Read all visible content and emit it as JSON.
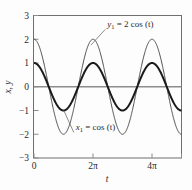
{
  "chart_data": {
    "type": "line",
    "title": "",
    "xlabel": "t",
    "ylabel": "x, y",
    "xlim": [
      0,
      15.708
    ],
    "ylim": [
      -3,
      3
    ],
    "grid": false,
    "legend_position": "inline-annotations",
    "x_ticks": [
      {
        "value": 0,
        "label": "0"
      },
      {
        "value": 6.2832,
        "label": "2π"
      },
      {
        "value": 12.5664,
        "label": "4π"
      },
      {
        "value": 15.708,
        "label": ""
      }
    ],
    "y_ticks": [
      {
        "value": 3,
        "label": "3"
      },
      {
        "value": 2,
        "label": "2"
      },
      {
        "value": 1,
        "label": "1"
      },
      {
        "value": 0,
        "label": "0"
      },
      {
        "value": -1,
        "label": "-1"
      },
      {
        "value": -2,
        "label": "-2"
      },
      {
        "value": -3,
        "label": "-3"
      }
    ],
    "zero_line": {
      "value": 0,
      "color": "#8c8c8c"
    },
    "series": [
      {
        "name": "y1",
        "expression": "y₁ = 2 cos (t)",
        "amplitude": 2,
        "phase": 0,
        "period": 6.2832,
        "linewidth": 0.9,
        "color": "#3a3a3a",
        "annotation": {
          "text": "y₁ = 2 cos (t)",
          "text_x": 7.8,
          "text_y": 2.52,
          "leader_to_x": 6.05,
          "leader_to_y": 1.75
        }
      },
      {
        "name": "x1",
        "expression": "x₁ = cos (t)",
        "amplitude": 1,
        "phase": 0,
        "period": 6.2832,
        "linewidth": 2.0,
        "color": "#1a1a1a",
        "annotation": {
          "text": "x₁ = cos (t)",
          "text_x": 4.45,
          "text_y": -1.82,
          "leader_to_x": 3.15,
          "leader_to_y": -0.98
        }
      }
    ]
  },
  "axis": {
    "y_label_text": "x, y",
    "x_label_text": "t"
  },
  "labels": {
    "y1_prefix": "y",
    "y1_sub": "1",
    "y1_rest": " = 2 cos (t)",
    "x1_prefix": "x",
    "x1_sub": "1",
    "x1_rest": " = cos (t)"
  },
  "colors": {
    "frame": "#6f6f6f",
    "zero_line": "#8c8c8c",
    "thin_curve": "#3a3a3a",
    "thick_curve": "#1a1a1a",
    "text": "#2a2a2a",
    "background": "#fdfdfd"
  }
}
